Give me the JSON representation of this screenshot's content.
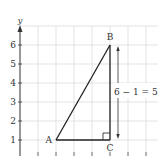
{
  "diagram": {
    "type": "coordinate-grid-right-triangle",
    "axis": {
      "y_label": "y"
    },
    "y_ticks": [
      "1",
      "2",
      "3",
      "4",
      "5",
      "6"
    ],
    "points": {
      "A": {
        "label": "A",
        "x": 2,
        "y": 1
      },
      "B": {
        "label": "B",
        "x": 5,
        "y": 6
      },
      "C": {
        "label": "C",
        "x": 5,
        "y": 1
      }
    },
    "annotation": "6 − 1 = 5",
    "colors": {
      "grid": "#dddddd",
      "line": "#333333",
      "text": "#333333"
    }
  }
}
